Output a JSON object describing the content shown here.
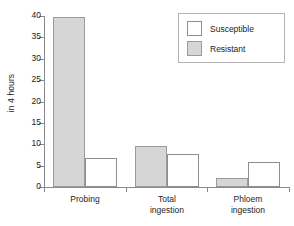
{
  "chart_data": {
    "type": "bar",
    "title": "",
    "subtitle": "",
    "xlabel": "",
    "ylabel": "in 4 hours",
    "categories": [
      "Probing",
      "Total\ningestion",
      "Phloem\ningestion"
    ],
    "series": [
      {
        "name": "Susceptible",
        "color": "#ffffff",
        "values": [
          6.9,
          7.7,
          5.8
        ]
      },
      {
        "name": "Resistant",
        "color": "#d6d6d6",
        "values": [
          39.8,
          9.7,
          2.0
        ]
      }
    ],
    "ylim": [
      0,
      40
    ],
    "ytick_labels": [
      "0",
      "5",
      "10",
      "15",
      "20",
      "25",
      "30",
      "35",
      "40"
    ],
    "ytick_values": [
      0,
      5,
      10,
      15,
      20,
      25,
      30,
      35,
      40
    ],
    "grid": false,
    "legend_position": "top-right",
    "legend_entries": [
      "Susceptible",
      "Resistant"
    ],
    "annotations": []
  },
  "axis": {
    "y_title": "in 4 hours"
  },
  "legend": {
    "items": [
      {
        "label": "Susceptible"
      },
      {
        "label": "Resistant"
      }
    ]
  },
  "categories": [
    {
      "label": "Probing"
    },
    {
      "label": "Total\ningestion"
    },
    {
      "label": "Phloem\ningestion"
    }
  ]
}
